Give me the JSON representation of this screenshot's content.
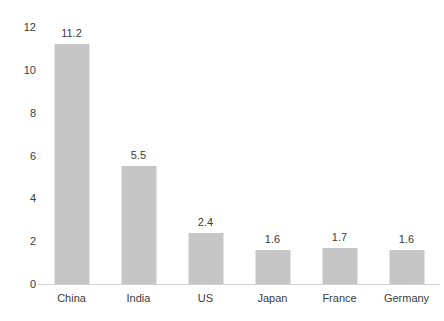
{
  "chart_data": {
    "type": "bar",
    "title": "",
    "subtitle": "",
    "xlabel": "",
    "ylabel": "",
    "categories": [
      "China",
      "India",
      "US",
      "Japan",
      "France",
      "Germany"
    ],
    "values": [
      11.2,
      5.5,
      2.4,
      1.6,
      1.7,
      1.6
    ],
    "value_labels": [
      "11.2",
      "5.5",
      "2.4",
      "1.6",
      "1.7",
      "1.6"
    ],
    "ylim": [
      0,
      12
    ],
    "ytick_values": [
      0,
      2,
      4,
      6,
      8,
      10,
      12
    ],
    "ytick_labels": [
      "0",
      "2",
      "4",
      "6",
      "8",
      "10",
      "12"
    ],
    "grid": false,
    "legend": false,
    "legend_position": "none",
    "bar_color": "#C6C6C6",
    "axis_color": "#D4D4D4",
    "text_color": "#3C3C3C",
    "background_color": "#FFFFFF",
    "data_labels_shown": true
  }
}
